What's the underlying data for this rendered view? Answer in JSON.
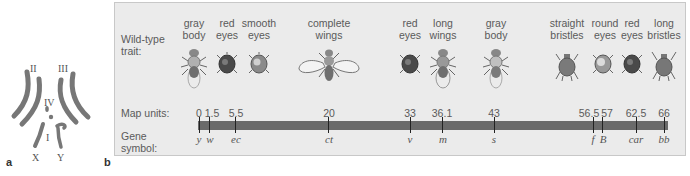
{
  "panel_a": {
    "label": "a",
    "chromosomes": [
      {
        "name": "II"
      },
      {
        "name": "III"
      },
      {
        "name": "IV"
      },
      {
        "name": "I"
      },
      {
        "name": "X"
      },
      {
        "name": "Y"
      }
    ]
  },
  "panel_b": {
    "label": "b",
    "row_labels": {
      "trait": "Wild-type\ntrait:",
      "trait_line1": "Wild-type",
      "trait_line2": "trait:",
      "map_units": "Map units:",
      "gene_line1": "Gene",
      "gene_line2": "symbol:"
    },
    "loci": [
      {
        "map_unit": "0",
        "gene": "y",
        "trait_line1": "gray",
        "trait_line2": "body",
        "icon": "fly-gray-body-icon"
      },
      {
        "map_unit": "1.5",
        "gene": "w",
        "trait_line1": "red",
        "trait_line2": "eyes",
        "icon": "fly-head-red-eyes-icon"
      },
      {
        "map_unit": "5.5",
        "gene": "ec",
        "trait_line1": "smooth",
        "trait_line2": "eyes",
        "icon": "fly-head-smooth-eyes-icon"
      },
      {
        "map_unit": "20",
        "gene": "ct",
        "trait_line1": "complete",
        "trait_line2": "wings",
        "icon": "fly-complete-wings-icon"
      },
      {
        "map_unit": "33",
        "gene": "v",
        "trait_line1": "red",
        "trait_line2": "eyes",
        "icon": "fly-head-red-eyes-icon"
      },
      {
        "map_unit": "36.1",
        "gene": "m",
        "trait_line1": "long",
        "trait_line2": "wings",
        "icon": "fly-long-wings-icon"
      },
      {
        "map_unit": "43",
        "gene": "s",
        "trait_line1": "gray",
        "trait_line2": "body",
        "icon": "fly-gray-body-icon"
      },
      {
        "map_unit": "56.5",
        "gene": "f",
        "trait_line1": "straight",
        "trait_line2": "bristles",
        "icon": "fly-thorax-straight-bristles-icon"
      },
      {
        "map_unit": "57",
        "gene": "B",
        "trait_line1": "round",
        "trait_line2": "eyes",
        "icon": "fly-head-round-eyes-icon"
      },
      {
        "map_unit": "62.5",
        "gene": "car",
        "trait_line1": "red",
        "trait_line2": "eyes",
        "icon": "fly-head-red-eyes-icon"
      },
      {
        "map_unit": "66",
        "gene": "bb",
        "trait_line1": "long",
        "trait_line2": "bristles",
        "icon": "fly-thorax-long-bristles-icon"
      }
    ],
    "colors": {
      "panel_bg": "#ebebeb",
      "chromosome_bar": "#6a6a6a",
      "tick": "#222222",
      "text": "#5a5a5a"
    }
  }
}
